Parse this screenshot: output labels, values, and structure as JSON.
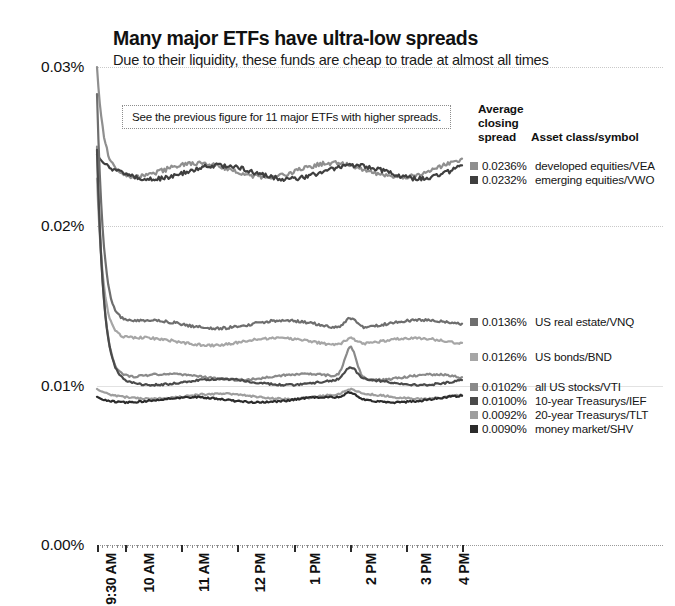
{
  "header": {
    "title": "Many major ETFs have ultra-low spreads",
    "subtitle": "Due to their liquidity, these funds are cheap to trade at almost all times"
  },
  "annotation": {
    "text": "See the previous figure for 11 major ETFs with higher spreads."
  },
  "legend": {
    "header_line1": "Average",
    "header_line2": "closing",
    "header_line3": "spread",
    "header_right": "Asset class/symbol",
    "rows": [
      {
        "value": "0.0236%",
        "name": "developed equities/VEA",
        "color": "#8f8f8f"
      },
      {
        "value": "0.0232%",
        "name": "emerging equities/VWO",
        "color": "#3f3f3f"
      },
      {
        "value": "0.0136%",
        "name": "US real estate/VNQ",
        "color": "#6e6e6e"
      },
      {
        "value": "0.0126%",
        "name": "US bonds/BND",
        "color": "#a6a6a6"
      },
      {
        "value": "0.0102%",
        "name": "all US stocks/VTI",
        "color": "#8a8a8a"
      },
      {
        "value": "0.0100%",
        "name": "10-year Treasurys/IEF",
        "color": "#4a4a4a"
      },
      {
        "value": "0.0092%",
        "name": "20-year Treasurys/TLT",
        "color": "#9e9e9e"
      },
      {
        "value": "0.0090%",
        "name": "money market/SHV",
        "color": "#2b2b2b"
      }
    ]
  },
  "axes": {
    "y_ticks": [
      "0.03%",
      "0.02%",
      "0.01%",
      "0.00%"
    ],
    "x_ticks": [
      "9:30 AM",
      "10 AM",
      "11 AM",
      "12 PM",
      "1 PM",
      "2 PM",
      "3 PM",
      "4 PM"
    ]
  },
  "chart_data": {
    "type": "line",
    "title": "Many major ETFs have ultra-low spreads",
    "subtitle": "Due to their liquidity, these funds are cheap to trade at almost all times",
    "xlabel": "",
    "ylabel": "",
    "ylim": [
      0.0,
      0.03
    ],
    "ytick_values": [
      0.03,
      0.02,
      0.01,
      0.0
    ],
    "ytick_labels": [
      "0.03%",
      "0.02%",
      "0.01%",
      "0.00%"
    ],
    "grid": true,
    "legend_position": "right",
    "x": [
      "9:30 AM",
      "10 AM",
      "11 AM",
      "12 PM",
      "1 PM",
      "2 PM",
      "3 PM",
      "4 PM"
    ],
    "x_note": "intraday trading session, 9:30 AM to 4:00 PM; series sampled at fine intraday intervals",
    "series": [
      {
        "name": "developed equities/VEA",
        "closing_spread": 0.0236,
        "color": "#8f8f8f",
        "values": [
          0.03,
          0.0243,
          0.0236,
          0.0234,
          0.0235,
          0.0233,
          0.0236,
          0.0238
        ]
      },
      {
        "name": "emerging equities/VWO",
        "closing_spread": 0.0232,
        "color": "#3f3f3f",
        "values": [
          0.0245,
          0.0236,
          0.0234,
          0.0233,
          0.0234,
          0.0232,
          0.0234,
          0.0237
        ]
      },
      {
        "name": "US real estate/VNQ",
        "closing_spread": 0.0136,
        "color": "#6e6e6e",
        "values": [
          0.0283,
          0.016,
          0.0138,
          0.0136,
          0.0137,
          0.0145,
          0.0135,
          0.014
        ]
      },
      {
        "name": "US bonds/BND",
        "closing_spread": 0.0126,
        "color": "#a6a6a6",
        "values": [
          0.023,
          0.0145,
          0.0128,
          0.0126,
          0.0127,
          0.0132,
          0.0125,
          0.0128
        ]
      },
      {
        "name": "all US stocks/VTI",
        "closing_spread": 0.0102,
        "color": "#8a8a8a",
        "values": [
          0.025,
          0.0118,
          0.0102,
          0.01,
          0.0101,
          0.0125,
          0.0101,
          0.0104
        ]
      },
      {
        "name": "10-year Treasurys/IEF",
        "closing_spread": 0.01,
        "color": "#4a4a4a",
        "values": [
          0.0248,
          0.0116,
          0.0101,
          0.01,
          0.01,
          0.011,
          0.01,
          0.0103
        ]
      },
      {
        "name": "20-year Treasurys/TLT",
        "closing_spread": 0.0092,
        "color": "#9e9e9e",
        "values": [
          0.0098,
          0.0094,
          0.0093,
          0.0092,
          0.0093,
          0.0096,
          0.0092,
          0.0094
        ]
      },
      {
        "name": "money market/SHV",
        "closing_spread": 0.009,
        "color": "#2b2b2b",
        "values": [
          0.0093,
          0.0091,
          0.009,
          0.009,
          0.009,
          0.0095,
          0.009,
          0.0092
        ]
      }
    ],
    "annotations": [
      {
        "text": "See the previous figure for 11 major ETFs with higher spreads."
      }
    ]
  }
}
